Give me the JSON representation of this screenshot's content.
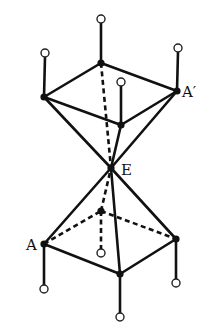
{
  "figure": {
    "labels": {
      "A": "A",
      "A_prime": "A′",
      "E": "E"
    },
    "colors": {
      "line": "#111111",
      "background": "#ffffff",
      "terminal_fill": "#ffffff"
    },
    "vertices": {
      "E": [
        111,
        168
      ],
      "upper_left": [
        44,
        97
      ],
      "upper_back": [
        101,
        63
      ],
      "upper_right_A_prime": [
        177,
        91
      ],
      "upper_front": [
        121,
        125
      ],
      "lower_left_A": [
        44,
        244
      ],
      "lower_back": [
        101,
        211
      ],
      "lower_right": [
        176,
        239
      ],
      "lower_front": [
        120,
        274
      ]
    },
    "terminals": {
      "upper_left": [
        45,
        53
      ],
      "upper_back": [
        101,
        19
      ],
      "upper_right_A_prime": [
        178,
        48
      ],
      "upper_front": [
        121,
        82
      ],
      "lower_left_A": [
        44,
        289
      ],
      "lower_back": [
        101,
        253
      ],
      "lower_right": [
        176,
        283
      ],
      "lower_front": [
        120,
        317
      ]
    }
  }
}
